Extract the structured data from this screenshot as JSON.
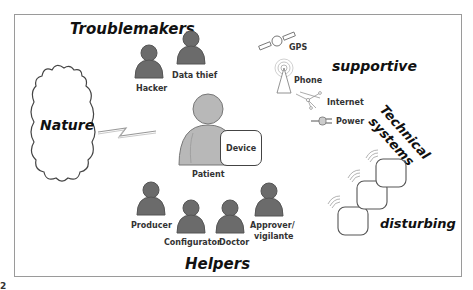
{
  "diagram": {
    "groups": {
      "troublemakers": "Troublemakers",
      "helpers": "Helpers",
      "supportive": "supportive",
      "technical_systems_line1": "Technical",
      "technical_systems_line2": "systems",
      "disturbing": "disturbing",
      "nature": "Nature"
    },
    "troublemakers": [
      {
        "label": "Hacker"
      },
      {
        "label": "Data thief"
      }
    ],
    "center": {
      "patient": "Patient",
      "device": "Device"
    },
    "helpers": [
      {
        "label": "Producer"
      },
      {
        "label": "Configurator"
      },
      {
        "label": "Doctor"
      },
      {
        "label": "Approver/"
      },
      {
        "label": "vigilante"
      }
    ],
    "technical_systems": [
      {
        "label": "GPS",
        "icon": "satellite-icon"
      },
      {
        "label": "Phone",
        "icon": "antenna-icon"
      },
      {
        "label": "Internet",
        "icon": "network-icon"
      },
      {
        "label": "Power",
        "icon": "plug-icon"
      }
    ],
    "colors": {
      "person_dark": "#6b6b6b",
      "person_light": "#b8b8b8",
      "frame": "#9a9a9a",
      "text": "#111111"
    },
    "footer_fragment": "2"
  }
}
